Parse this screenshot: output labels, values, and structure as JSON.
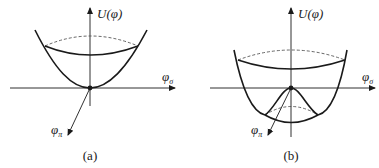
{
  "figure": {
    "panels": [
      {
        "id": "a",
        "caption": "(a)",
        "y_axis_label": "U(φ)",
        "x_axis_label": "φ",
        "x_axis_sub": "σ",
        "z_axis_label": "φ",
        "z_axis_sub": "π",
        "potential_shape": "single-well paraboloid (minimum at origin)"
      },
      {
        "id": "b",
        "caption": "(b)",
        "y_axis_label": "U(φ)",
        "x_axis_label": "φ",
        "x_axis_sub": "σ",
        "z_axis_label": "φ",
        "z_axis_sub": "π",
        "potential_shape": "Mexican-hat potential (local maximum at origin, ring of minima)"
      }
    ],
    "colors": {
      "stroke": "#1a1a1a",
      "dashed": "#555555",
      "background": "#ffffff"
    }
  }
}
